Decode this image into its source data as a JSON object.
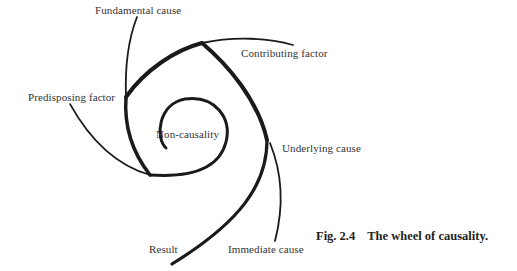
{
  "figure": {
    "caption_number": "Fig. 2.4",
    "caption_title": "The wheel of causality."
  },
  "labels": {
    "fundamental_cause": "Fundamental cause",
    "contributing_factor": "Contributing factor",
    "predisposing_factor": "Predisposing factor",
    "non_causality": "Non-causality",
    "underlying_cause": "Underlying cause",
    "result": "Result",
    "immediate_cause": "Immediate cause"
  },
  "colors": {
    "stroke": "#1a1a1a",
    "text": "#333333",
    "background": "#ffffff"
  }
}
